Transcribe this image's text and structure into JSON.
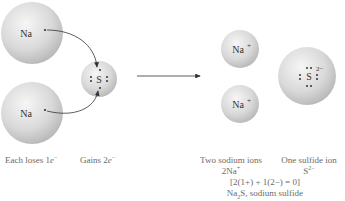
{
  "reactants": {
    "sodium_atoms": [
      {
        "symbol": "Na",
        "electron_dot": "•"
      },
      {
        "symbol": "Na",
        "electron_dot": "•"
      }
    ],
    "sulfur_atom": {
      "symbol": "S",
      "valence_electrons": 6
    },
    "labels": {
      "sodium_caption_prefix": "Each loses 1",
      "sodium_caption_e": "e",
      "sodium_caption_sup": "−",
      "sulfur_caption_prefix": "Gains 2",
      "sulfur_caption_e": "e",
      "sulfur_caption_sup": "−"
    }
  },
  "reaction_arrow": {
    "direction": "right"
  },
  "products": {
    "sodium_ions": [
      {
        "symbol": "Na",
        "charge": "+"
      },
      {
        "symbol": "Na",
        "charge": "+"
      }
    ],
    "sulfide_ion": {
      "symbol": "S",
      "charge": "2−",
      "valence_electrons": 8
    },
    "labels": {
      "sodium_caption": "Two sodium ions",
      "sodium_formula": "2Na",
      "sodium_formula_sup": "+",
      "sulfide_caption": "One sulfide ion",
      "sulfide_formula": "S",
      "sulfide_formula_sup": "2−",
      "charge_balance": "[2(1+) + 1(2−) = 0]",
      "compound_prefix": "Na",
      "compound_sub": "2",
      "compound_suffix": "S, sodium sulfide"
    }
  },
  "colors": {
    "sphere_light": "#f4f4f4",
    "sphere_dark": "#b8b8b8",
    "text": "#333333",
    "caption": "#6a6a6a",
    "arrow": "#333333"
  }
}
